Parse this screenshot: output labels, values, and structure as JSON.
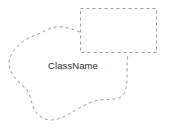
{
  "diagram": {
    "type": "uml-region-overlap",
    "background_color": "#ffffff",
    "stroke_color": "#9a9a9a",
    "label_color": "#2b2b2b",
    "shapes": [
      {
        "name": "class-region-blob",
        "kind": "irregular-closed-region",
        "border_style": "dashed",
        "label": "ClassName",
        "label_position": {
          "x": 48,
          "y": 61
        },
        "path": "M 80,32 C 72,29 64,26 56,27 C 48,28 42,33 36,35 C 30,37 24,40 19,45 C 13,50 9,57 9,63 C 9,69 12,74 16,79 C 20,84 25,87 28,92 C 31,97 31,103 34,109 C 37,115 43,120 51,120 C 59,120 68,115 76,110 C 84,105 92,101 100,100 C 108,99 116,100 121,97 C 126,93 127,85 127,77 C 127,69 127,61 128,54"
      },
      {
        "name": "overlapping-rectangle",
        "kind": "rectangle",
        "border_style": "dashed",
        "x": 80,
        "y": 8,
        "width": 77,
        "height": 45
      }
    ]
  },
  "labels": {
    "class_name": "ClassName"
  }
}
